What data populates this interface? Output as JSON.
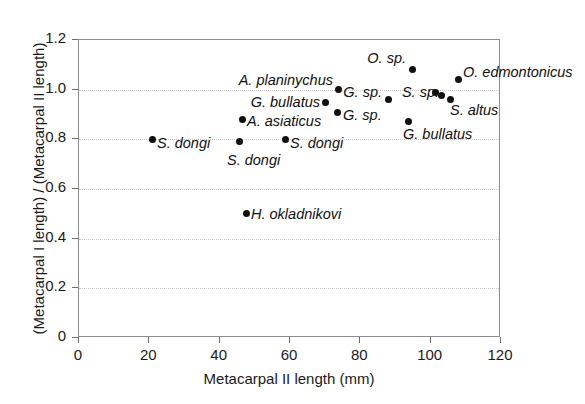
{
  "chart_data": {
    "type": "scatter",
    "title": "",
    "xlabel": "Metacarpal II length (mm)",
    "ylabel": "(Metacarpal I length) / (Metacarpal II length)",
    "xlim": [
      0,
      120
    ],
    "ylim": [
      0,
      1.2
    ],
    "xticks": [
      "0",
      "20",
      "40",
      "60",
      "80",
      "100",
      "120"
    ],
    "xtick_values": [
      0,
      20,
      40,
      60,
      80,
      100,
      120
    ],
    "yticks": [
      "0",
      "0.2",
      "0.4",
      "0.6",
      "0.8",
      "1.0",
      "1.2"
    ],
    "ytick_values": [
      0,
      0.2,
      0.4,
      0.6,
      0.8,
      1.0,
      1.2
    ],
    "grid": "horizontal-dotted",
    "legend": "none",
    "marker": "filled-circle-black",
    "points": [
      {
        "label": "S. dongi",
        "x": 21.0,
        "y": 0.8,
        "label_pos": "right"
      },
      {
        "label": "S. dongi",
        "x": 45.5,
        "y": 0.79,
        "label_pos": "below"
      },
      {
        "label": "S. dongi",
        "x": 58.6,
        "y": 0.8,
        "label_pos": "right"
      },
      {
        "label": "A. asiaticus",
        "x": 46.6,
        "y": 0.88,
        "label_pos": "right"
      },
      {
        "label": "G. bullatus",
        "x": 70.2,
        "y": 0.95,
        "label_pos": "left"
      },
      {
        "label": "A. planinychus",
        "x": 73.9,
        "y": 1.0,
        "label_pos": "left"
      },
      {
        "label": "G. sp.",
        "x": 73.6,
        "y": 0.91,
        "label_pos": "right"
      },
      {
        "label": "G. sp.",
        "x": 88.1,
        "y": 0.96,
        "label_pos": "left"
      },
      {
        "label": "O. sp.",
        "x": 94.7,
        "y": 1.08,
        "label_pos": "left"
      },
      {
        "label": "G. bullatus",
        "x": 93.6,
        "y": 0.87,
        "label_pos": "below"
      },
      {
        "label": "O. edmontonicus",
        "x": 108.0,
        "y": 1.04,
        "label_pos": "right"
      },
      {
        "label": "S. sp.",
        "x": 101.5,
        "y": 0.99,
        "label_pos": "left"
      },
      {
        "label": "S. altus",
        "x": 103.2,
        "y": 0.975,
        "label_pos": "none"
      },
      {
        "label": "S. altus",
        "x": 105.5,
        "y": 0.96,
        "label_pos": "right"
      },
      {
        "label": "H. okladnikovi",
        "x": 47.5,
        "y": 0.5,
        "label_pos": "right"
      }
    ],
    "labels": [
      {
        "text": "S. dongi",
        "x": 157,
        "y": 143,
        "align": "right"
      },
      {
        "text": "S. dongi",
        "x": 227,
        "y": 160,
        "align": "right"
      },
      {
        "text": "S. dongi",
        "x": 290,
        "y": 143,
        "align": "right"
      },
      {
        "text": "A. asiaticus",
        "x": 247,
        "y": 121,
        "align": "right"
      },
      {
        "text": "G. bullatus",
        "x": 320,
        "y": 102,
        "align": "left"
      },
      {
        "text": "A. planinychus",
        "x": 333,
        "y": 80,
        "align": "left"
      },
      {
        "text": "G. sp.",
        "x": 343,
        "y": 115,
        "align": "right"
      },
      {
        "text": "G. sp.",
        "x": 382,
        "y": 92,
        "align": "left"
      },
      {
        "text": "O. sp.",
        "x": 406,
        "y": 58,
        "align": "left"
      },
      {
        "text": "G. bullatus",
        "x": 403,
        "y": 134,
        "align": "right"
      },
      {
        "text": "O. edmontonicus",
        "x": 463,
        "y": 72,
        "align": "right"
      },
      {
        "text": "S. sp.",
        "x": 439,
        "y": 92,
        "align": "left"
      },
      {
        "text": "S. altus",
        "x": 450,
        "y": 110,
        "align": "right"
      },
      {
        "text": "H. okladnikovi",
        "x": 251,
        "y": 214,
        "align": "right"
      }
    ]
  }
}
